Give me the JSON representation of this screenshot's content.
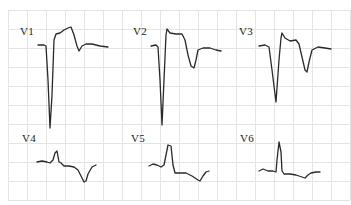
{
  "chart_data": {
    "type": "line",
    "title": "",
    "grid": {
      "on": true,
      "color": "#e4e4e4",
      "x0": 8,
      "y0": 10,
      "spacing": 19,
      "cols": 18,
      "rows": 10
    },
    "trace_color": "#2a2a2a",
    "leads": [
      {
        "name": "V1",
        "label_pos": [
          20,
          35
        ],
        "points": [
          [
            38,
            45
          ],
          [
            44,
            45
          ],
          [
            46,
            46
          ],
          [
            48,
            80
          ],
          [
            50,
            128
          ],
          [
            52,
            95
          ],
          [
            54,
            40
          ],
          [
            56,
            34
          ],
          [
            60,
            33
          ],
          [
            64,
            30
          ],
          [
            68,
            28
          ],
          [
            71,
            27
          ],
          [
            74,
            35
          ],
          [
            77,
            46
          ],
          [
            79,
            51
          ],
          [
            82,
            46
          ],
          [
            86,
            44
          ],
          [
            92,
            44
          ],
          [
            100,
            46
          ],
          [
            108,
            47
          ]
        ]
      },
      {
        "name": "V2",
        "label_pos": [
          133,
          35
        ],
        "points": [
          [
            151,
            46
          ],
          [
            156,
            45
          ],
          [
            158,
            47
          ],
          [
            160,
            80
          ],
          [
            162,
            125
          ],
          [
            164,
            80
          ],
          [
            166,
            35
          ],
          [
            167,
            29
          ],
          [
            170,
            33
          ],
          [
            176,
            34
          ],
          [
            182,
            34
          ],
          [
            185,
            40
          ],
          [
            188,
            55
          ],
          [
            191,
            66
          ],
          [
            194,
            68
          ],
          [
            196,
            60
          ],
          [
            198,
            50
          ],
          [
            203,
            48
          ],
          [
            210,
            48
          ],
          [
            216,
            50
          ],
          [
            221,
            51
          ]
        ]
      },
      {
        "name": "V3",
        "label_pos": [
          239,
          35
        ],
        "points": [
          [
            259,
            46
          ],
          [
            265,
            45
          ],
          [
            269,
            47
          ],
          [
            272,
            70
          ],
          [
            276,
            102
          ],
          [
            279,
            60
          ],
          [
            281,
            38
          ],
          [
            282,
            33
          ],
          [
            285,
            38
          ],
          [
            290,
            41
          ],
          [
            296,
            40
          ],
          [
            299,
            44
          ],
          [
            302,
            57
          ],
          [
            305,
            70
          ],
          [
            307,
            72
          ],
          [
            309,
            62
          ],
          [
            312,
            50
          ],
          [
            318,
            47
          ],
          [
            325,
            48
          ],
          [
            331,
            49
          ]
        ]
      },
      {
        "name": "V4",
        "label_pos": [
          22,
          142
        ],
        "points": [
          [
            37,
            162
          ],
          [
            42,
            161
          ],
          [
            47,
            162
          ],
          [
            50,
            163
          ],
          [
            53,
            160
          ],
          [
            55,
            153
          ],
          [
            57,
            151
          ],
          [
            59,
            162
          ],
          [
            61,
            163
          ],
          [
            64,
            166
          ],
          [
            69,
            166
          ],
          [
            74,
            167
          ],
          [
            78,
            170
          ],
          [
            81,
            176
          ],
          [
            84,
            182
          ],
          [
            86,
            181
          ],
          [
            88,
            174
          ],
          [
            92,
            167
          ],
          [
            96,
            165
          ]
        ]
      },
      {
        "name": "V5",
        "label_pos": [
          131,
          142
        ],
        "points": [
          [
            149,
            166
          ],
          [
            153,
            164
          ],
          [
            157,
            165
          ],
          [
            161,
            167
          ],
          [
            164,
            165
          ],
          [
            168,
            145
          ],
          [
            171,
            146
          ],
          [
            173,
            165
          ],
          [
            175,
            173
          ],
          [
            180,
            173
          ],
          [
            186,
            173
          ],
          [
            192,
            176
          ],
          [
            198,
            180
          ],
          [
            200,
            181
          ],
          [
            203,
            176
          ],
          [
            206,
            172
          ],
          [
            209,
            171
          ]
        ]
      },
      {
        "name": "V6",
        "label_pos": [
          240,
          142
        ],
        "points": [
          [
            259,
            171
          ],
          [
            263,
            169
          ],
          [
            268,
            171
          ],
          [
            273,
            171
          ],
          [
            276,
            172
          ],
          [
            277,
            160
          ],
          [
            279,
            142
          ],
          [
            281,
            152
          ],
          [
            282,
            171
          ],
          [
            284,
            174
          ],
          [
            290,
            174
          ],
          [
            296,
            175
          ],
          [
            302,
            177
          ],
          [
            305,
            178
          ],
          [
            308,
            175
          ],
          [
            311,
            173
          ],
          [
            316,
            172
          ],
          [
            320,
            172
          ]
        ]
      }
    ]
  }
}
